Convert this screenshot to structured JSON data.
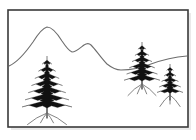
{
  "artwork": {
    "title": "Mountain Landscape with Fir Trees",
    "medium": "black-and-white line drawing",
    "background_color": "#ffffff",
    "ink_color": "#111111",
    "ridge_color": "#6d6d6d",
    "frame_color": "#3a3a3a"
  },
  "frame": {
    "name": "picture-frame",
    "x": 8,
    "y": 10,
    "width": 180,
    "height": 117,
    "stroke_width": 1.6,
    "shadow": true
  },
  "ridge": {
    "name": "mountain-ridge",
    "stroke_color": "#6d6d6d",
    "description": "two-peak mountain skyline descending left to right then rising at far right",
    "path": "M 9,66 C 18,62 26,52 33,42 C 38,34 43,28 47,27 C 52,27 57,33 62,41 C 66,47 69,51 72,52 C 76,52 80,48 84,45 C 87,43 89,43 91,45 C 96,50 101,58 107,64 C 112,68 116,70 121,70 C 131,70 141,68 151,64 C 162,60 175,57 187,56"
  },
  "trees": [
    {
      "name": "tree-large-left",
      "size": "large",
      "tip_x": 47,
      "tip_y": 57,
      "base_y": 108,
      "half_width": 25,
      "tiers": 7,
      "trunk_height": 10,
      "roots": 4
    },
    {
      "name": "tree-medium-right",
      "size": "medium",
      "tip_x": 142,
      "tip_y": 43,
      "base_y": 81,
      "half_width": 18,
      "tiers": 6,
      "trunk_height": 8,
      "roots": 4
    },
    {
      "name": "tree-small-far-right",
      "size": "small",
      "tip_x": 170,
      "tip_y": 65,
      "base_y": 93,
      "half_width": 13,
      "tiers": 5,
      "trunk_height": 7,
      "roots": 3
    }
  ]
}
